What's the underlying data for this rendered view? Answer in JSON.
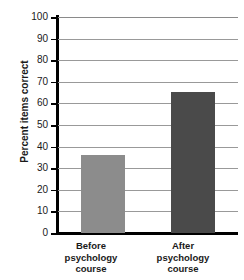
{
  "chart_data": {
    "type": "bar",
    "title": "",
    "xlabel": "",
    "ylabel": "Percent items correct",
    "categories": [
      "Before psychology course",
      "After psychology course"
    ],
    "category_lines": [
      [
        "Before",
        "psychology",
        "course"
      ],
      [
        "After",
        "psychology",
        "course"
      ]
    ],
    "values": [
      36,
      65.5
    ],
    "ylim": [
      0,
      100
    ],
    "ytick_step": 10,
    "yticks": [
      0,
      10,
      20,
      30,
      40,
      50,
      60,
      70,
      80,
      90,
      100
    ],
    "ytick_labels": [
      "0",
      "10",
      "20",
      "30",
      "40",
      "50",
      "60",
      "70",
      "80",
      "90",
      "100"
    ],
    "grid": true,
    "grid_axis": "y",
    "legend": false,
    "bar_colors": [
      "#8c8c8c",
      "#4a4a4a"
    ],
    "axis_color": "#000000",
    "grid_color": "#999999",
    "text_color": "#1a1a1a",
    "background": "#ffffff"
  }
}
